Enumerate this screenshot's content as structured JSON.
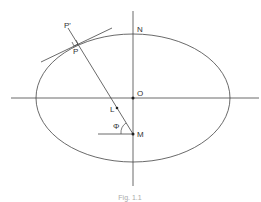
{
  "diagram": {
    "labels": {
      "P_prime": "P'",
      "P": "P",
      "N": "N",
      "O": "O",
      "L": "L",
      "M": "M",
      "phi": "Φ"
    },
    "caption": "Fig. 1.1",
    "colors": {
      "stroke": "#333333",
      "background": "#ffffff"
    }
  }
}
